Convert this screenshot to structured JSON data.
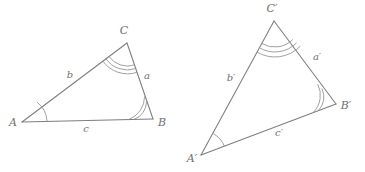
{
  "figure": {
    "stroke_color": "#7d7d82",
    "arc_color": "#8f8f95",
    "label_color": "#6f6f74",
    "background": "#ffffff"
  },
  "triangles": [
    {
      "name": "triangle-abc",
      "vertices": [
        {
          "id": "A",
          "label": "A",
          "x": 22,
          "y": 122,
          "label_x": 13,
          "label_y": 123,
          "arc_count": 1
        },
        {
          "id": "B",
          "label": "B",
          "x": 153,
          "y": 119,
          "label_x": 162,
          "label_y": 123,
          "arc_count": 2
        },
        {
          "id": "C",
          "label": "C",
          "x": 127,
          "y": 43,
          "label_x": 124,
          "label_y": 31,
          "arc_count": 3
        }
      ],
      "sides": [
        {
          "id": "a",
          "label": "a",
          "from": "B",
          "to": "C",
          "label_x": 147,
          "label_y": 76
        },
        {
          "id": "b",
          "label": "b",
          "from": "A",
          "to": "C",
          "label_x": 70,
          "label_y": 75
        },
        {
          "id": "c",
          "label": "c",
          "from": "A",
          "to": "B",
          "label_x": 86,
          "label_y": 129
        }
      ]
    },
    {
      "name": "triangle-abc-prime",
      "vertices": [
        {
          "id": "Ap",
          "label": "A′",
          "x": 201,
          "y": 155,
          "label_x": 192,
          "label_y": 159,
          "arc_count": 1
        },
        {
          "id": "Bp",
          "label": "B′",
          "x": 336,
          "y": 104,
          "label_x": 346,
          "label_y": 106,
          "arc_count": 2
        },
        {
          "id": "Cp",
          "label": "C′",
          "x": 274,
          "y": 21,
          "label_x": 272,
          "label_y": 9,
          "arc_count": 3
        }
      ],
      "sides": [
        {
          "id": "ap",
          "label": "a′",
          "from": "Bp",
          "to": "Cp",
          "label_x": 317,
          "label_y": 57
        },
        {
          "id": "bp",
          "label": "b′",
          "from": "Ap",
          "to": "Cp",
          "label_x": 231,
          "label_y": 78
        },
        {
          "id": "cp",
          "label": "c′",
          "from": "Ap",
          "to": "Bp",
          "label_x": 279,
          "label_y": 133
        }
      ]
    }
  ]
}
